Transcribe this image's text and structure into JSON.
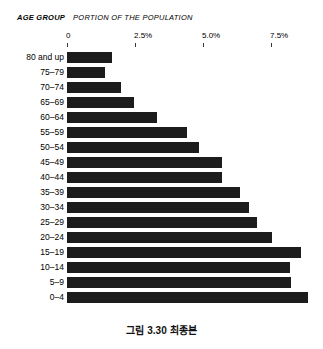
{
  "header": {
    "age_group_title": "AGE GROUP",
    "portion_title": "PORTION OF THE POPULATION"
  },
  "caption": "그림 3.30 최종본",
  "chart_data": {
    "type": "bar",
    "orientation": "horizontal",
    "title": "PORTION OF THE POPULATION",
    "xlabel": "PORTION OF THE POPULATION",
    "ylabel": "AGE GROUP",
    "grid": false,
    "legend": "none",
    "xlim": [
      0,
      9.0
    ],
    "xticks": [
      0,
      2.5,
      5.0,
      7.5
    ],
    "xtick_labels": [
      "0",
      "2.5%",
      "5.0%",
      "7.5%"
    ],
    "bar_color": "#1c1c1c",
    "categories": [
      "80 and up",
      "75–79",
      "70–74",
      "65–69",
      "60–64",
      "55–59",
      "50–54",
      "45–49",
      "40–44",
      "35–39",
      "30–34",
      "25–29",
      "20–24",
      "15–19",
      "10–14",
      "5–9",
      "0–4"
    ],
    "values": [
      1.65,
      1.4,
      2.0,
      2.45,
      3.3,
      4.4,
      4.85,
      5.7,
      5.7,
      6.35,
      6.7,
      7.0,
      7.55,
      8.6,
      8.2,
      8.25,
      8.85
    ],
    "value_unit": "%"
  }
}
